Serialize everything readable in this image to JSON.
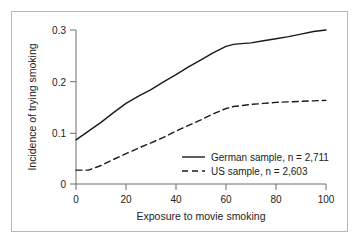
{
  "chart_data": {
    "type": "line",
    "title": "",
    "xlabel": "Exposure to movie smoking",
    "ylabel": "Incidence of trying smoking",
    "xlim": [
      0,
      100
    ],
    "ylim": [
      0,
      0.3
    ],
    "xticks": [
      0,
      20,
      40,
      60,
      80,
      100
    ],
    "xtick_labels": [
      "0",
      "20",
      "40",
      "60",
      "80",
      "100"
    ],
    "yticks": [
      0,
      0.1,
      0.2,
      0.3
    ],
    "ytick_labels": [
      "0",
      "0.1",
      "0.2",
      "0.3"
    ],
    "grid": false,
    "legend_position": "lower right",
    "series": [
      {
        "name": "German sample, n = 2,711",
        "style": "solid",
        "color": "#1a1a1a",
        "x": [
          0,
          5,
          10,
          15,
          20,
          25,
          30,
          35,
          40,
          45,
          50,
          55,
          60,
          63,
          65,
          70,
          75,
          80,
          85,
          90,
          95,
          100
        ],
        "y": [
          0.086,
          0.103,
          0.12,
          0.139,
          0.157,
          0.171,
          0.184,
          0.199,
          0.213,
          0.228,
          0.242,
          0.256,
          0.268,
          0.272,
          0.273,
          0.275,
          0.279,
          0.283,
          0.287,
          0.292,
          0.297,
          0.3
        ]
      },
      {
        "name": "US sample, n = 2,603",
        "style": "dashed",
        "color": "#1a1a1a",
        "x": [
          0,
          5,
          10,
          15,
          20,
          25,
          30,
          35,
          40,
          45,
          50,
          55,
          60,
          63,
          65,
          70,
          75,
          80,
          85,
          90,
          95,
          100
        ],
        "y": [
          0.027,
          0.027,
          0.036,
          0.048,
          0.059,
          0.07,
          0.08,
          0.091,
          0.103,
          0.114,
          0.125,
          0.137,
          0.147,
          0.151,
          0.152,
          0.155,
          0.157,
          0.159,
          0.16,
          0.161,
          0.162,
          0.163
        ]
      }
    ]
  },
  "legend": {
    "entries": [
      {
        "label": "German sample, n = 2,711",
        "style": "solid"
      },
      {
        "label": "US sample, n = 2,603",
        "style": "dashed"
      }
    ]
  },
  "axes": {
    "x_title": "Exposure to movie smoking",
    "y_title": "Incidence of trying smoking",
    "x_tick_0": "0",
    "x_tick_1": "20",
    "x_tick_2": "40",
    "x_tick_3": "60",
    "x_tick_4": "80",
    "x_tick_5": "100",
    "y_tick_0": "0",
    "y_tick_1": "0.1",
    "y_tick_2": "0.2",
    "y_tick_3": "0.3"
  },
  "colors": {
    "line": "#1a1a1a",
    "axis": "#6f6c69",
    "border": "#b9b6b3",
    "background": "#ffffff"
  }
}
